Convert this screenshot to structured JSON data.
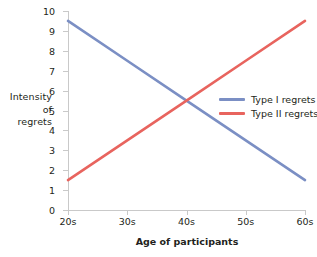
{
  "chart_data": {
    "type": "line",
    "title": "",
    "xlabel": "Age of participants",
    "ylabel": "Intensity of regrets",
    "ylabel_lines": [
      "Intensity",
      "of",
      "regrets"
    ],
    "x": [
      "20s",
      "30s",
      "40s",
      "50s",
      "60s"
    ],
    "categories": [
      "20s",
      "30s",
      "40s",
      "50s",
      "60s"
    ],
    "xticklabels": [
      "20s",
      "30s",
      "40s",
      "50s",
      "60s"
    ],
    "yticklabels": [
      "0",
      "1",
      "2",
      "3",
      "4",
      "5",
      "6",
      "7",
      "8",
      "9",
      "10"
    ],
    "yticks": [
      0,
      1,
      2,
      3,
      4,
      5,
      6,
      7,
      8,
      9,
      10
    ],
    "ylim": [
      0,
      10
    ],
    "xlim": [
      0,
      4
    ],
    "grid": false,
    "legend_position": "center-right-inside",
    "series": [
      {
        "name": "Type I regrets",
        "color": "#7b8fc4",
        "values": [
          9.5,
          7.5,
          5.5,
          3.5,
          1.5
        ]
      },
      {
        "name": "Type II regrets",
        "color": "#e8645e",
        "values": [
          1.5,
          3.5,
          5.5,
          7.5,
          9.5
        ]
      }
    ],
    "annotations": []
  },
  "legend": {
    "items": [
      {
        "label": "Type I regrets",
        "color": "#7b8fc4"
      },
      {
        "label": "Type II regrets",
        "color": "#e8645e"
      }
    ]
  },
  "colors": {
    "series_1": "#7b8fc4",
    "series_2": "#e8645e",
    "axis": "#c9c9c9",
    "text": "#231f20",
    "background": "#ffffff"
  }
}
